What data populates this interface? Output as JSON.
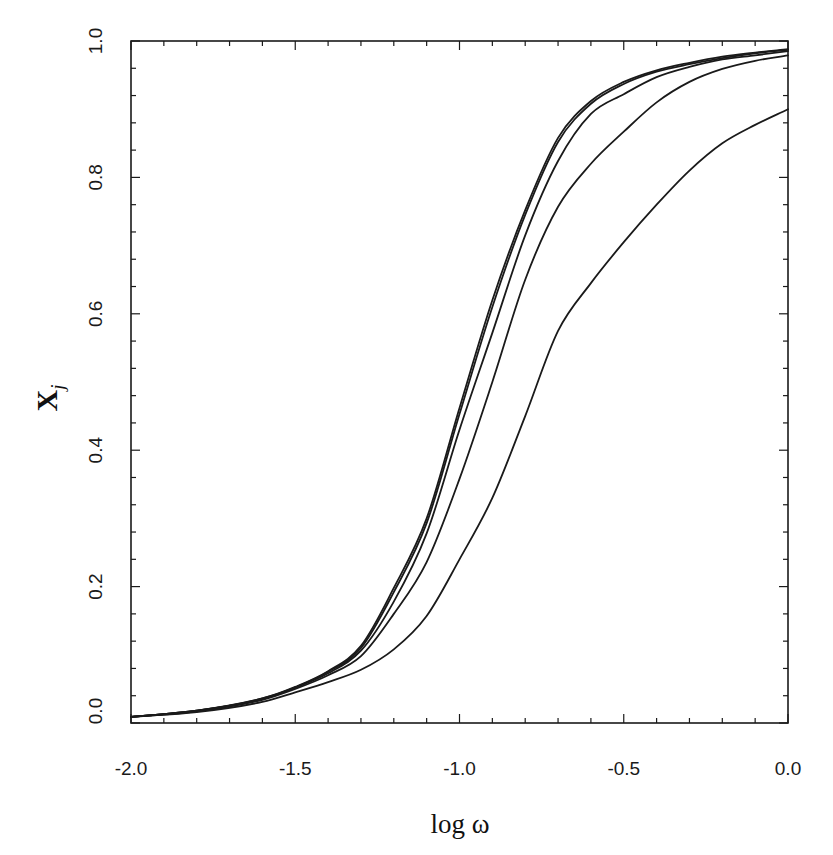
{
  "chart_data": {
    "type": "line",
    "title": "",
    "xlabel": "log ω",
    "ylabel": "X_j",
    "ylabel_main": "X",
    "ylabel_sub": "j",
    "xlim": [
      -2.0,
      0.0
    ],
    "ylim": [
      0.0,
      1.0
    ],
    "grid": false,
    "legend": null,
    "x_ticks": [
      "-2.0",
      "-1.5",
      "-1.0",
      "-0.5",
      "0.0"
    ],
    "x_tick_values": [
      -2.0,
      -1.5,
      -1.0,
      -0.5,
      0.0
    ],
    "x_minor_step": 0.1,
    "y_ticks": [
      "0.0",
      "0.2",
      "0.4",
      "0.6",
      "0.8",
      "1.0"
    ],
    "y_tick_values": [
      0.0,
      0.2,
      0.4,
      0.6,
      0.8,
      1.0
    ],
    "y_minor_step": 0.04,
    "x": [
      -2.0,
      -1.8,
      -1.6,
      -1.5,
      -1.4,
      -1.3,
      -1.2,
      -1.1,
      -1.0,
      -0.9,
      -0.8,
      -0.7,
      -0.6,
      -0.5,
      -0.4,
      -0.3,
      -0.2,
      -0.1,
      0.0
    ],
    "series": [
      {
        "name": "curve 1",
        "values": [
          0.009,
          0.018,
          0.036,
          0.053,
          0.076,
          0.113,
          0.198,
          0.3,
          0.462,
          0.62,
          0.752,
          0.858,
          0.912,
          0.94,
          0.957,
          0.968,
          0.977,
          0.983,
          0.988
        ]
      },
      {
        "name": "curve 2",
        "values": [
          0.009,
          0.018,
          0.036,
          0.052,
          0.075,
          0.11,
          0.192,
          0.293,
          0.453,
          0.61,
          0.745,
          0.852,
          0.908,
          0.937,
          0.955,
          0.966,
          0.975,
          0.982,
          0.987
        ]
      },
      {
        "name": "curve 3",
        "values": [
          0.009,
          0.018,
          0.035,
          0.052,
          0.073,
          0.106,
          0.178,
          0.278,
          0.43,
          0.572,
          0.715,
          0.824,
          0.893,
          0.922,
          0.947,
          0.962,
          0.973,
          0.979,
          0.985
        ]
      },
      {
        "name": "curve 4",
        "values": [
          0.009,
          0.017,
          0.034,
          0.05,
          0.07,
          0.098,
          0.16,
          0.236,
          0.358,
          0.5,
          0.65,
          0.757,
          0.82,
          0.867,
          0.91,
          0.94,
          0.959,
          0.971,
          0.979
        ]
      },
      {
        "name": "curve 5",
        "values": [
          0.009,
          0.016,
          0.031,
          0.045,
          0.06,
          0.078,
          0.108,
          0.157,
          0.24,
          0.33,
          0.45,
          0.575,
          0.645,
          0.705,
          0.76,
          0.81,
          0.85,
          0.877,
          0.9
        ]
      }
    ],
    "line_color": "#1a1a1a",
    "background": "#ffffff"
  }
}
